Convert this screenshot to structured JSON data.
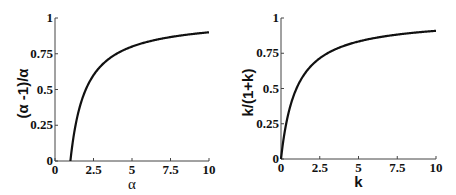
{
  "chart_data": [
    {
      "type": "line",
      "title": "",
      "xlabel": "α",
      "ylabel": "(α -1)/α",
      "xlim": [
        0,
        10
      ],
      "ylim": [
        0,
        1
      ],
      "x_ticks": [
        "0",
        "2.5",
        "5",
        "7.5",
        "10"
      ],
      "y_ticks": [
        "0",
        "0.25",
        "0.5",
        "0.75",
        "1"
      ],
      "grid": false,
      "series": [
        {
          "name": "(α-1)/α",
          "x": [
            1,
            1.25,
            1.5,
            2,
            2.5,
            3,
            4,
            5,
            6,
            7,
            8,
            9,
            10
          ],
          "y": [
            0,
            0.2,
            0.333,
            0.5,
            0.6,
            0.667,
            0.75,
            0.8,
            0.833,
            0.857,
            0.875,
            0.889,
            0.9
          ]
        }
      ]
    },
    {
      "type": "line",
      "title": "",
      "xlabel": "k",
      "ylabel": "k/(1+k)",
      "xlim": [
        0,
        10
      ],
      "ylim": [
        0,
        1
      ],
      "x_ticks": [
        "0",
        "2.5",
        "5",
        "7.5",
        "10"
      ],
      "y_ticks": [
        "0",
        "0.25",
        "0.5",
        "0.75",
        "1"
      ],
      "grid": false,
      "series": [
        {
          "name": "k/(1+k)",
          "x": [
            0,
            0.25,
            0.5,
            1,
            1.5,
            2,
            2.5,
            3,
            4,
            5,
            6,
            7,
            8,
            9,
            10
          ],
          "y": [
            0,
            0.2,
            0.333,
            0.5,
            0.6,
            0.667,
            0.714,
            0.75,
            0.8,
            0.833,
            0.857,
            0.875,
            0.889,
            0.9,
            0.909
          ]
        }
      ]
    }
  ],
  "layout": {
    "panels": [
      {
        "x0": 55,
        "x1": 209,
        "y0": 161,
        "y1": 18
      },
      {
        "x0": 281,
        "x1": 436,
        "y0": 159,
        "y1": 18
      }
    ]
  }
}
